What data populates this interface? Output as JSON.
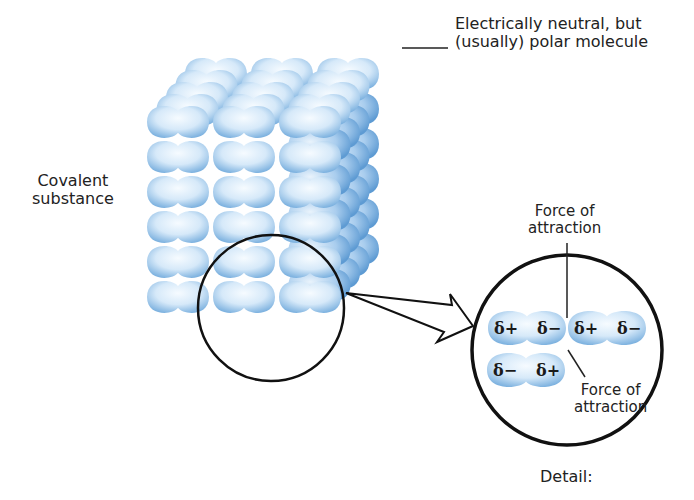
{
  "labels": {
    "molecule_line1": "Electrically neutral, but",
    "molecule_line2": "(usually) polar molecule",
    "substance_line1": "Covalent",
    "substance_line2": "substance",
    "force_top_line1": "Force of",
    "force_top_line2": "attraction",
    "force_bottom_line1": "Force of",
    "force_bottom_line2": "attraction",
    "detail": "Detail:"
  },
  "detail_molecules": [
    {
      "left_charge": "δ+",
      "right_charge": "δ−"
    },
    {
      "left_charge": "δ+",
      "right_charge": "δ−"
    },
    {
      "left_charge": "δ−",
      "right_charge": "δ+"
    }
  ],
  "lattice": {
    "rows": 6,
    "columns": 3,
    "depth_layers": 5
  },
  "colors": {
    "molecule_light": "#eef6fd",
    "molecule_mid": "#b9d8f2",
    "molecule_dark": "#6fa8dc",
    "outline": "#111111"
  }
}
